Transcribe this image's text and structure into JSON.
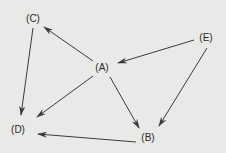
{
  "diagram": {
    "type": "directed-graph",
    "background": "#e9e9e7",
    "edge_color": "#3a3a3a",
    "nodes": [
      {
        "id": "A",
        "label": "(A)",
        "x": 102,
        "y": 68
      },
      {
        "id": "B",
        "label": "(B)",
        "x": 148,
        "y": 138
      },
      {
        "id": "C",
        "label": "(C)",
        "x": 33,
        "y": 19
      },
      {
        "id": "D",
        "label": "(D)",
        "x": 18,
        "y": 130
      },
      {
        "id": "E",
        "label": "(E)",
        "x": 206,
        "y": 38
      }
    ],
    "edges": [
      {
        "from": "A",
        "to": "C",
        "x1": 93,
        "y1": 61,
        "x2": 44,
        "y2": 27
      },
      {
        "from": "E",
        "to": "A",
        "x1": 194,
        "y1": 40,
        "x2": 118,
        "y2": 63
      },
      {
        "from": "A",
        "to": "D",
        "x1": 93,
        "y1": 76,
        "x2": 37,
        "y2": 117
      },
      {
        "from": "A",
        "to": "B",
        "x1": 110,
        "y1": 77,
        "x2": 139,
        "y2": 128
      },
      {
        "from": "E",
        "to": "B",
        "x1": 207,
        "y1": 48,
        "x2": 159,
        "y2": 126
      },
      {
        "from": "C",
        "to": "D",
        "x1": 33,
        "y1": 28,
        "x2": 21,
        "y2": 115
      },
      {
        "from": "B",
        "to": "D",
        "x1": 136,
        "y1": 142,
        "x2": 38,
        "y2": 134
      }
    ]
  }
}
